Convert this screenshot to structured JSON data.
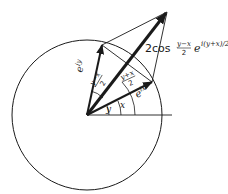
{
  "diagram": {
    "type": "vector addition on unit circle (complex plane)",
    "geometry": {
      "origin": [
        87,
        115
      ],
      "circle_radius": 75,
      "vector_eiy_tip": [
        102,
        45
      ],
      "vector_eix_tip": [
        152,
        82
      ],
      "sum_tip": [
        167,
        12
      ],
      "axis_end": [
        172,
        116
      ]
    },
    "labels": {
      "eiy_base": "e",
      "eiy_exp": "iy",
      "eix_base": "e",
      "eix_exp": "ix",
      "sum_coeff": "2cos",
      "sum_frac_num": "y−x",
      "sum_frac_den": "2",
      "sum_exp_base": "e",
      "sum_exp": "i(y+x)/2",
      "angle_half_diff_num": "y−x",
      "angle_half_diff_den": "2",
      "angle_half_sum_num": "y+x",
      "angle_half_sum_den": "2",
      "angle_y": "y",
      "angle_x": "x"
    },
    "colors": {
      "stroke": "#1a1a1a",
      "background": "#ffffff"
    }
  }
}
